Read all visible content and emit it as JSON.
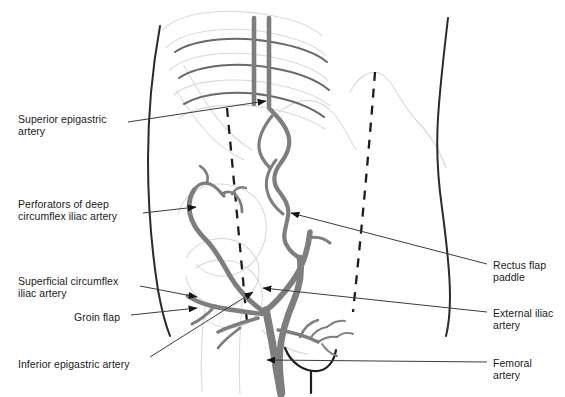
{
  "figure": {
    "background_color": "#ffffff",
    "artery_color": "#7c7c7c",
    "outline_color": "#2b2b2b",
    "faint_color": "#d8d8d8",
    "leader_color": "#3a3a3a",
    "width": 565,
    "height": 397
  },
  "labels_left": [
    {
      "name": "superior-epigastric-artery",
      "text": "Superior epigastric\nartery",
      "x": 18,
      "y": 113
    },
    {
      "name": "perforators-of-deep-circumflex-iliac-artery",
      "text": "Perforators of deep\ncircumflex iliac artery",
      "x": 18,
      "y": 198
    },
    {
      "name": "superficial-circumflex-iliac-artery",
      "text": "Superficial circumflex\niliac artery",
      "x": 18,
      "y": 275
    },
    {
      "name": "groin-flap",
      "text": "Groin flap",
      "x": 74,
      "y": 311
    },
    {
      "name": "inferior-epigastric-artery",
      "text": "Inferior epigastric artery",
      "x": 18,
      "y": 358
    }
  ],
  "labels_right": [
    {
      "name": "rectus-flap-paddle",
      "text": "Rectus flap\npaddle",
      "x": 493,
      "y": 259
    },
    {
      "name": "external-iliac-artery",
      "text": "External iliac\nartery",
      "x": 493,
      "y": 307
    },
    {
      "name": "femoral-artery",
      "text": "Femoral\nartery",
      "x": 493,
      "y": 357
    }
  ],
  "anatomy": {
    "items": [
      "torso-outline-left",
      "torso-outline-right",
      "rib-cage",
      "iliac-crest",
      "pubic-symphysis",
      "rectus-flap-dashed-left",
      "rectus-flap-dashed-right",
      "rectus-flap-paddle-shade"
    ]
  },
  "arteries": {
    "items": [
      "superior-epigastric-artery",
      "internal-mammary-arteries",
      "inferior-epigastric-artery",
      "external-iliac-artery",
      "femoral-artery",
      "deep-circumflex-iliac-artery",
      "superficial-circumflex-iliac-artery",
      "perforator-branches"
    ]
  }
}
